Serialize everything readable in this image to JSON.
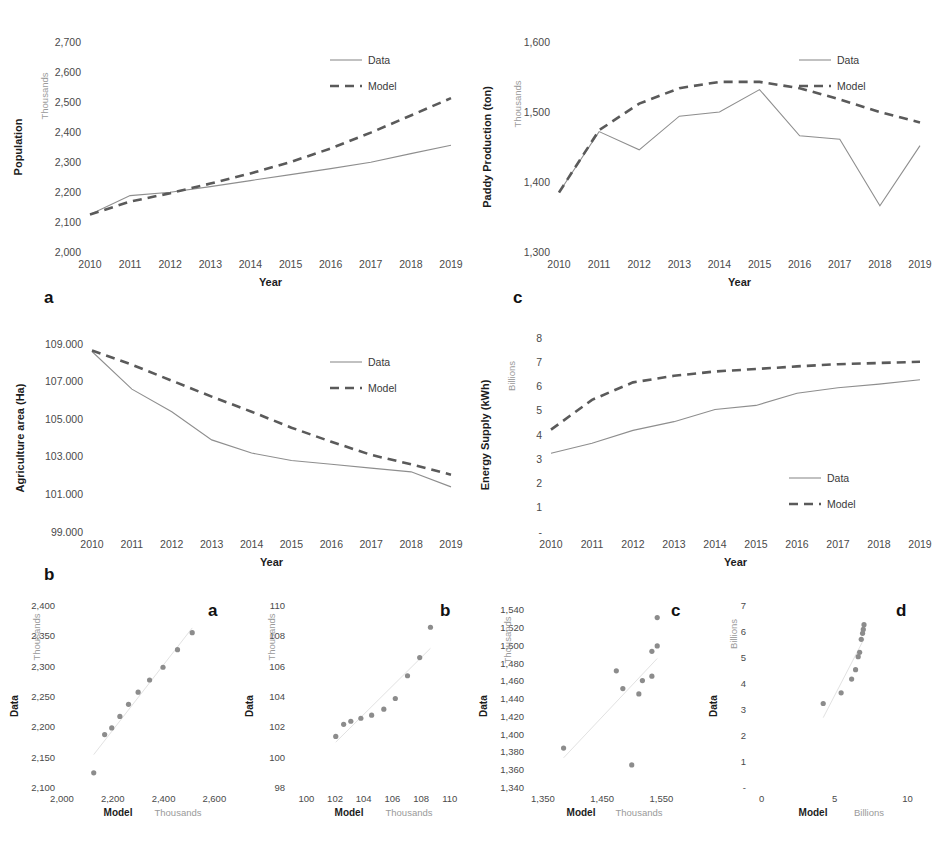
{
  "top_strip_text": "",
  "caption": "",
  "legend": {
    "data": "Data",
    "model": "Model"
  },
  "axis": {
    "year": "Year",
    "model": "Model",
    "data": "Data",
    "thousands": "Thousands",
    "billions": "Billions"
  },
  "panels": {
    "a": "a",
    "b": "b",
    "c": "c",
    "d": "d"
  },
  "chart_data": [
    {
      "id": "population-time-series",
      "panel": "a",
      "type": "line",
      "title": "",
      "xlabel": "Year",
      "ylabel": "Population",
      "yunit": "Thousands",
      "x": [
        2010,
        2011,
        2012,
        2013,
        2014,
        2015,
        2016,
        2017,
        2018,
        2019
      ],
      "xticklabels": [
        "2010",
        "2011",
        "2012",
        "2013",
        "2014",
        "2015",
        "2016",
        "2017",
        "2018",
        "2019"
      ],
      "yticks": [
        2000,
        2100,
        2200,
        2300,
        2400,
        2500,
        2600,
        2700
      ],
      "yticklabels": [
        "2,000",
        "2,100",
        "2,200",
        "2,300",
        "2,400",
        "2,500",
        "2,600",
        "2,700"
      ],
      "ylim": [
        2000,
        2700
      ],
      "grid": false,
      "legend_position": "top-right",
      "series": [
        {
          "name": "Data",
          "style": "solid",
          "values": [
            2125,
            2188,
            2199,
            2218,
            2238,
            2258,
            2278,
            2299,
            2328,
            2356
          ]
        },
        {
          "name": "Model",
          "style": "dashed",
          "values": [
            2125,
            2168,
            2196,
            2228,
            2262,
            2300,
            2345,
            2398,
            2455,
            2513
          ]
        }
      ]
    },
    {
      "id": "paddy-production-time-series",
      "panel": "c",
      "type": "line",
      "title": "",
      "xlabel": "Year",
      "ylabel": "Paddy Production (ton)",
      "yunit": "Thousands",
      "x": [
        2010,
        2011,
        2012,
        2013,
        2014,
        2015,
        2016,
        2017,
        2018,
        2019
      ],
      "xticklabels": [
        "2010",
        "2011",
        "2012",
        "2013",
        "2014",
        "2015",
        "2016",
        "2017",
        "2018",
        "2019"
      ],
      "yticks": [
        1300,
        1400,
        1500,
        1600
      ],
      "yticklabels": [
        "1,300",
        "1,400",
        "1,500",
        "1,600"
      ],
      "ylim": [
        1300,
        1600
      ],
      "grid": false,
      "legend_position": "top-right",
      "series": [
        {
          "name": "Data",
          "style": "solid",
          "values": [
            1385,
            1472,
            1446,
            1494,
            1500,
            1532,
            1466,
            1461,
            1366,
            1452
          ]
        },
        {
          "name": "Model",
          "style": "dashed",
          "values": [
            1385,
            1474,
            1512,
            1534,
            1543,
            1543,
            1534,
            1518,
            1500,
            1485
          ]
        }
      ]
    },
    {
      "id": "agriculture-area-time-series",
      "panel": "b",
      "type": "line",
      "title": "",
      "xlabel": "Year",
      "ylabel": "Agriculture area (Ha)",
      "yunit": "",
      "x": [
        2010,
        2011,
        2012,
        2013,
        2014,
        2015,
        2016,
        2017,
        2018,
        2019
      ],
      "xticklabels": [
        "2010",
        "2011",
        "2012",
        "2013",
        "2014",
        "2015",
        "2016",
        "2017",
        "2018",
        "2019"
      ],
      "yticks": [
        99000,
        101000,
        103000,
        105000,
        107000,
        109000
      ],
      "yticklabels": [
        "99.000",
        "101.000",
        "103.000",
        "105.000",
        "107.000",
        "109.000"
      ],
      "ylim": [
        99000,
        109000
      ],
      "grid": false,
      "legend_position": "top-right",
      "series": [
        {
          "name": "Data",
          "style": "solid",
          "values": [
            108600,
            106600,
            105400,
            103900,
            103200,
            102800,
            102600,
            102400,
            102200,
            101400
          ]
        },
        {
          "name": "Model",
          "style": "dashed",
          "values": [
            108650,
            107900,
            107050,
            106200,
            105400,
            104550,
            103800,
            103100,
            102600,
            102050
          ]
        }
      ]
    },
    {
      "id": "energy-supply-time-series",
      "panel": "d",
      "type": "line",
      "title": "",
      "xlabel": "Year",
      "ylabel": "Energy Supply (kWh)",
      "yunit": "Billions",
      "x": [
        2010,
        2011,
        2012,
        2013,
        2014,
        2015,
        2016,
        2017,
        2018,
        2019
      ],
      "xticklabels": [
        "2010",
        "2011",
        "2012",
        "2013",
        "2014",
        "2015",
        "2016",
        "2017",
        "2018",
        "2019"
      ],
      "yticks": [
        0,
        1,
        2,
        3,
        4,
        5,
        6,
        7,
        8
      ],
      "yticklabels": [
        "-",
        "1",
        "2",
        "3",
        "4",
        "5",
        "6",
        "7",
        "8"
      ],
      "ylim": [
        0,
        8
      ],
      "grid": false,
      "legend_position": "bottom-right",
      "series": [
        {
          "name": "Data",
          "style": "solid",
          "values": [
            3.25,
            3.66,
            4.19,
            4.55,
            5.05,
            5.22,
            5.72,
            5.95,
            6.1,
            6.28
          ]
        },
        {
          "name": "Model",
          "style": "dashed",
          "values": [
            4.22,
            5.45,
            6.17,
            6.44,
            6.62,
            6.72,
            6.83,
            6.92,
            6.97,
            7.02
          ]
        }
      ]
    },
    {
      "id": "population-scatter",
      "panel": "a",
      "type": "scatter",
      "xlabel": "Model",
      "ylabel": "Data",
      "xunit": "Thousands",
      "yunit": "Thousands",
      "xticks": [
        2000,
        2200,
        2400,
        2600
      ],
      "xticklabels": [
        "2,000",
        "2,200",
        "2,400",
        "2,600"
      ],
      "yticks": [
        2100,
        2150,
        2200,
        2250,
        2300,
        2350,
        2400
      ],
      "yticklabels": [
        "2,100",
        "2,150",
        "2,200",
        "2,250",
        "2,300",
        "2,350",
        "2,400"
      ],
      "xlim": [
        2000,
        2650
      ],
      "ylim": [
        2100,
        2400
      ],
      "points": [
        {
          "x": 2125,
          "y": 2125
        },
        {
          "x": 2168,
          "y": 2188
        },
        {
          "x": 2196,
          "y": 2199
        },
        {
          "x": 2228,
          "y": 2218
        },
        {
          "x": 2262,
          "y": 2238
        },
        {
          "x": 2300,
          "y": 2258
        },
        {
          "x": 2345,
          "y": 2278
        },
        {
          "x": 2398,
          "y": 2299
        },
        {
          "x": 2455,
          "y": 2328
        },
        {
          "x": 2513,
          "y": 2356
        }
      ]
    },
    {
      "id": "agriculture-area-scatter",
      "panel": "b",
      "type": "scatter",
      "xlabel": "Model",
      "ylabel": "Data",
      "xunit": "Thousands",
      "yunit": "Thousands",
      "xticks": [
        100,
        102,
        104,
        106,
        108,
        110
      ],
      "xticklabels": [
        "100",
        "102",
        "104",
        "106",
        "108",
        "110"
      ],
      "yticks": [
        98,
        100,
        102,
        104,
        106,
        108,
        110
      ],
      "yticklabels": [
        "98",
        "100",
        "102",
        "104",
        "106",
        "108",
        "110"
      ],
      "xlim": [
        99,
        110.5
      ],
      "ylim": [
        98,
        110
      ],
      "points": [
        {
          "x": 102.05,
          "y": 101.4
        },
        {
          "x": 102.6,
          "y": 102.2
        },
        {
          "x": 103.1,
          "y": 102.4
        },
        {
          "x": 103.8,
          "y": 102.6
        },
        {
          "x": 104.55,
          "y": 102.8
        },
        {
          "x": 105.4,
          "y": 103.2
        },
        {
          "x": 106.2,
          "y": 103.9
        },
        {
          "x": 107.05,
          "y": 105.4
        },
        {
          "x": 107.9,
          "y": 106.6
        },
        {
          "x": 108.65,
          "y": 108.6
        }
      ]
    },
    {
      "id": "paddy-production-scatter",
      "panel": "c",
      "type": "scatter",
      "xlabel": "Model",
      "ylabel": "Data",
      "xunit": "Thousands",
      "yunit": "Thousands",
      "xticks": [
        1350,
        1450,
        1550
      ],
      "xticklabels": [
        "1,350",
        "1,450",
        "1,550"
      ],
      "yticks": [
        1340,
        1360,
        1380,
        1400,
        1420,
        1440,
        1460,
        1480,
        1500,
        1520,
        1540
      ],
      "yticklabels": [
        "1,340",
        "1,360",
        "1,380",
        "1,400",
        "1,420",
        "1,440",
        "1,460",
        "1,480",
        "1,500",
        "1,520",
        "1,540"
      ],
      "xlim": [
        1330,
        1600
      ],
      "ylim": [
        1340,
        1545
      ],
      "points": [
        {
          "x": 1385,
          "y": 1385
        },
        {
          "x": 1474,
          "y": 1472
        },
        {
          "x": 1512,
          "y": 1446
        },
        {
          "x": 1534,
          "y": 1494
        },
        {
          "x": 1543,
          "y": 1500
        },
        {
          "x": 1543,
          "y": 1532
        },
        {
          "x": 1534,
          "y": 1466
        },
        {
          "x": 1518,
          "y": 1461
        },
        {
          "x": 1500,
          "y": 1366
        },
        {
          "x": 1485,
          "y": 1452
        }
      ]
    },
    {
      "id": "energy-supply-scatter",
      "panel": "d",
      "type": "scatter",
      "xlabel": "Model",
      "ylabel": "Data",
      "xunit": "Billions",
      "yunit": "Billions",
      "xticks": [
        0,
        5,
        10
      ],
      "xticklabels": [
        "0",
        "5",
        "10"
      ],
      "yticks": [
        0,
        1,
        2,
        3,
        4,
        5,
        6,
        7
      ],
      "yticklabels": [
        "-",
        "1",
        "2",
        "3",
        "4",
        "5",
        "6",
        "7"
      ],
      "xlim": [
        -0.6,
        11
      ],
      "ylim": [
        0,
        7
      ],
      "points": [
        {
          "x": 4.22,
          "y": 3.25
        },
        {
          "x": 5.45,
          "y": 3.66
        },
        {
          "x": 6.17,
          "y": 4.19
        },
        {
          "x": 6.44,
          "y": 4.55
        },
        {
          "x": 6.62,
          "y": 5.05
        },
        {
          "x": 6.72,
          "y": 5.22
        },
        {
          "x": 6.83,
          "y": 5.72
        },
        {
          "x": 6.92,
          "y": 5.95
        },
        {
          "x": 6.97,
          "y": 6.1
        },
        {
          "x": 7.02,
          "y": 6.28
        }
      ]
    }
  ]
}
